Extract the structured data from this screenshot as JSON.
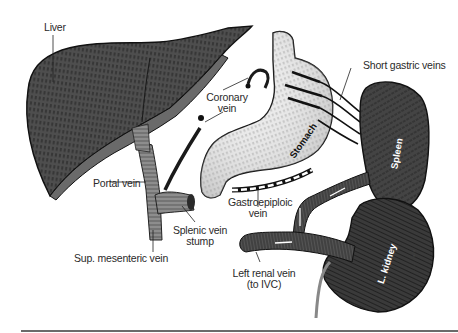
{
  "figure": {
    "labels": {
      "liver": "Liver",
      "coronary_vein_line1": "Coronary",
      "coronary_vein_line2": "vein",
      "short_gastric_veins": "Short gastric veins",
      "stomach": "Stomach",
      "spleen": "Spleen",
      "portal_vein": "Portal vein",
      "splenic_vein_stump_line1": "Splenic vein",
      "splenic_vein_stump_line2": "stump",
      "sup_mesenteric_vein": "Sup. mesenteric vein",
      "gastroepiploic_vein_line1": "Gastroepiploic",
      "gastroepiploic_vein_line2": "vein",
      "splenic_v": "Splenic v.",
      "left_renal_vein_line1": "Left renal vein",
      "left_renal_vein_line2": "(to IVC)",
      "l_kidney": "L. kidney",
      "artist_mark": "B·B·   ·····"
    },
    "colors": {
      "dark_organ": "#3d3d3d",
      "liver": "#4a4a4a",
      "stomach": "#e8e8e8",
      "vessel": "#8a8a8a",
      "outline": "#111111",
      "label_text": "#2a2a2a",
      "rule": "#6a6a6a"
    }
  }
}
